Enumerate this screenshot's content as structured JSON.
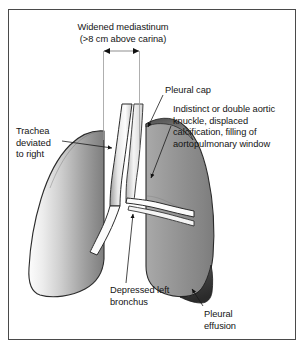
{
  "figure": {
    "type": "medical-illustration",
    "frame_border_color": "#4a4a4a",
    "background_color": "#ffffff"
  },
  "labels": {
    "widened_mediastinum": {
      "line1": "Widened mediastinum",
      "line2": "(>8 cm above carina)"
    },
    "pleural_cap": "Pleural cap",
    "aortic_knuckle": {
      "line1": "Indistinct or double aortic",
      "line2": "knuckle, displaced",
      "line3": "calcification, filling of",
      "line4": "aortopulmonary window"
    },
    "trachea_deviated": {
      "line1": "Trachea",
      "line2": "deviated",
      "line3": "to right"
    },
    "depressed_bronchus": {
      "line1": "Depressed left",
      "line2": "bronchus"
    },
    "pleural_effusion": {
      "line1": "Pleural",
      "line2": "effusion"
    }
  },
  "anatomy": {
    "right_lung": {
      "name": "right-lung",
      "fill_light": "#f2f2f2",
      "fill_dark": "#808080",
      "outline": "#2b2b2b"
    },
    "left_lung": {
      "name": "left-lung",
      "fill_light": "#b0b0b0",
      "fill_dark": "#6e6e6e",
      "outline": "#2b2b2b"
    },
    "pleural_cap": {
      "name": "pleural-cap",
      "fill": "#595959"
    },
    "pleural_effusion": {
      "name": "pleural-effusion",
      "fill": "#3a3a3a"
    },
    "trachea": {
      "name": "trachea-airway",
      "fill": "#ffffff",
      "shading": "#9a9a9a",
      "outline": "#2b2b2b"
    },
    "bronchi": {
      "name": "main-bronchi",
      "fill": "#ffffff",
      "outline": "#2b2b2b"
    }
  },
  "measure": {
    "name": "mediastinum-width-measure",
    "arrow_color": "#1a1a1a",
    "guide_color": "#8a8a8a",
    "left_x": 103,
    "right_x": 140,
    "arrow_y": 51,
    "guide_bottom_y": 150
  },
  "leaders": {
    "color": "#1a1a1a",
    "count": 6
  }
}
